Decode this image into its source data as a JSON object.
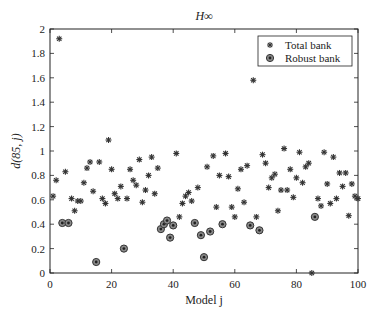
{
  "chart_data": {
    "type": "scatter",
    "title": "H∞",
    "xlabel": "Model j",
    "ylabel": "d(85, j)",
    "xlim": [
      0,
      100
    ],
    "ylim": [
      0,
      2
    ],
    "xticks": [
      0,
      20,
      40,
      60,
      80,
      100
    ],
    "yticks": [
      0,
      0.2,
      0.4,
      0.6,
      0.8,
      1,
      1.2,
      1.4,
      1.6,
      1.8,
      2
    ],
    "ytick_labels": [
      "0",
      "0.2",
      "0.4",
      "0.6",
      "0.8",
      "1",
      "1.2",
      "1.4",
      "1.6",
      "1.8",
      "2"
    ],
    "grid": false,
    "legend_position": "upper right",
    "legend": [
      "Total bank",
      "Robust bank"
    ],
    "series": [
      {
        "name": "Total bank",
        "marker": "asterisk",
        "points": [
          [
            1,
            0.63
          ],
          [
            2,
            0.76
          ],
          [
            3,
            1.92
          ],
          [
            5,
            0.83
          ],
          [
            7,
            0.61
          ],
          [
            8,
            0.51
          ],
          [
            9,
            0.59
          ],
          [
            10,
            0.59
          ],
          [
            11,
            0.74
          ],
          [
            12,
            0.86
          ],
          [
            13,
            0.91
          ],
          [
            14,
            0.67
          ],
          [
            16,
            0.91
          ],
          [
            17,
            0.61
          ],
          [
            18,
            0.57
          ],
          [
            19,
            1.09
          ],
          [
            20,
            0.85
          ],
          [
            21,
            0.65
          ],
          [
            22,
            0.61
          ],
          [
            23,
            0.71
          ],
          [
            25,
            0.61
          ],
          [
            26,
            0.85
          ],
          [
            27,
            0.76
          ],
          [
            28,
            0.72
          ],
          [
            29,
            0.93
          ],
          [
            30,
            0.58
          ],
          [
            31,
            0.68
          ],
          [
            32,
            0.8
          ],
          [
            33,
            0.95
          ],
          [
            34,
            0.65
          ],
          [
            35,
            0.86
          ],
          [
            41,
            0.98
          ],
          [
            42,
            0.46
          ],
          [
            43,
            0.57
          ],
          [
            44,
            0.63
          ],
          [
            45,
            0.66
          ],
          [
            46,
            0.59
          ],
          [
            48,
            0.7
          ],
          [
            51,
            0.87
          ],
          [
            53,
            0.96
          ],
          [
            54,
            0.54
          ],
          [
            55,
            0.8
          ],
          [
            57,
            0.98
          ],
          [
            58,
            0.79
          ],
          [
            59,
            0.54
          ],
          [
            60,
            0.46
          ],
          [
            61,
            0.69
          ],
          [
            62,
            0.85
          ],
          [
            63,
            0.58
          ],
          [
            64,
            0.88
          ],
          [
            66,
            1.58
          ],
          [
            67,
            0.46
          ],
          [
            69,
            0.97
          ],
          [
            70,
            0.9
          ],
          [
            71,
            0.7
          ],
          [
            72,
            0.78
          ],
          [
            73,
            0.81
          ],
          [
            74,
            0.51
          ],
          [
            75,
            0.68
          ],
          [
            76,
            1.02
          ],
          [
            77,
            0.68
          ],
          [
            78,
            0.85
          ],
          [
            79,
            0.62
          ],
          [
            80,
            0.78
          ],
          [
            81,
            0.99
          ],
          [
            82,
            0.74
          ],
          [
            83,
            0.87
          ],
          [
            84,
            0.9
          ],
          [
            85,
            0.0
          ],
          [
            87,
            0.61
          ],
          [
            88,
            0.55
          ],
          [
            89,
            0.99
          ],
          [
            90,
            0.73
          ],
          [
            91,
            0.57
          ],
          [
            92,
            0.95
          ],
          [
            93,
            0.61
          ],
          [
            94,
            0.82
          ],
          [
            95,
            0.71
          ],
          [
            96,
            0.82
          ],
          [
            97,
            0.47
          ],
          [
            98,
            0.73
          ],
          [
            99,
            0.63
          ],
          [
            100,
            0.61
          ]
        ]
      },
      {
        "name": "Robust bank",
        "marker": "circled-dot",
        "points": [
          [
            4,
            0.41
          ],
          [
            6,
            0.41
          ],
          [
            15,
            0.09
          ],
          [
            24,
            0.2
          ],
          [
            36,
            0.36
          ],
          [
            37,
            0.4
          ],
          [
            38,
            0.43
          ],
          [
            39,
            0.29
          ],
          [
            40,
            0.39
          ],
          [
            47,
            0.41
          ],
          [
            49,
            0.31
          ],
          [
            50,
            0.13
          ],
          [
            52,
            0.34
          ],
          [
            56,
            0.4
          ],
          [
            65,
            0.39
          ],
          [
            68,
            0.35
          ],
          [
            86,
            0.46
          ]
        ]
      }
    ]
  },
  "colors": {
    "axis": "#222222",
    "marker": "#333333",
    "robust_fill": "#8a8a8a",
    "background": "#ffffff"
  }
}
